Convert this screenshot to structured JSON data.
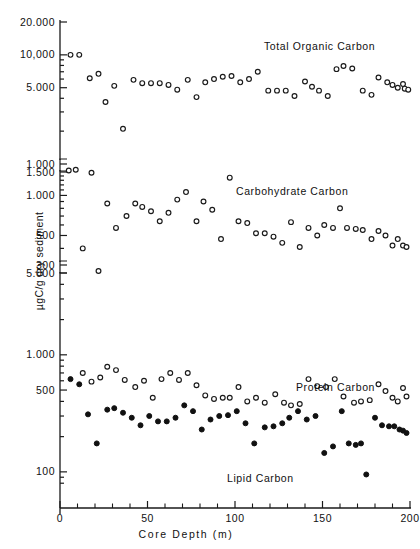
{
  "chart_data": {
    "type": "scatter",
    "title": "",
    "xlabel": "Core Depth (m)",
    "ylabel": "µgC/g dry sediment",
    "xlim": [
      0,
      200
    ],
    "xticks_major": [
      0,
      50,
      100,
      150,
      200
    ],
    "xtick_labels": [
      "0",
      "50",
      "100",
      "150",
      "200"
    ],
    "xticks_minor_step": 10,
    "grid": false,
    "legend": "inline-annotations",
    "axis_style": "three stacked broken log panels, open and filled circle markers",
    "panels": [
      {
        "name": "panel-top",
        "series_shown": [
          "Total Organic Carbon"
        ],
        "scale": "log",
        "ylim": [
          1000,
          20000
        ],
        "yticks_labeled": [
          20000,
          10000,
          5000,
          1000
        ],
        "ytick_labels": [
          "20.000",
          "10,000",
          "5.000",
          "1.000"
        ]
      },
      {
        "name": "panel-middle",
        "series_shown": [
          "Carbohydrate Carbon"
        ],
        "scale": "log",
        "ylim": [
          300,
          1500
        ],
        "yticks_labeled": [
          1500,
          1000,
          500,
          300
        ],
        "ytick_labels": [
          "1.500",
          "1.000",
          "500",
          "300"
        ]
      },
      {
        "name": "panel-bottom",
        "series_shown": [
          "Protein Carbon",
          "Lipid Carbon"
        ],
        "scale": "log",
        "ylim": [
          70,
          5000
        ],
        "yticks_labeled": [
          5000,
          1000,
          500,
          100
        ],
        "ytick_labels": [
          "5.000",
          "1.000",
          "500",
          "100"
        ]
      }
    ],
    "annotations": [
      {
        "text": "Total Organic Carbon",
        "x": 120,
        "y": 8000,
        "panel": "panel-top"
      },
      {
        "text": "Carbohydrate Carbon",
        "x": 120,
        "y": 1050,
        "panel": "panel-middle"
      },
      {
        "text": "Protein Carbon",
        "x": 152,
        "y": 560,
        "panel": "panel-bottom"
      },
      {
        "text": "Lipid Carbon",
        "x": 100,
        "y": 108,
        "panel": "panel-bottom"
      }
    ],
    "series": [
      {
        "name": "Total Organic Carbon",
        "marker": "open-circle",
        "color": "#1a1a1a",
        "points": [
          [
            6,
            10000
          ],
          [
            11,
            10000
          ],
          [
            17,
            6100
          ],
          [
            22,
            6700
          ],
          [
            26,
            3700
          ],
          [
            31,
            5200
          ],
          [
            36,
            2100
          ],
          [
            42,
            5900
          ],
          [
            47,
            5500
          ],
          [
            52,
            5500
          ],
          [
            57,
            5500
          ],
          [
            62,
            5300
          ],
          [
            67,
            4800
          ],
          [
            73,
            5900
          ],
          [
            78,
            4100
          ],
          [
            83,
            5600
          ],
          [
            88,
            6000
          ],
          [
            93,
            6300
          ],
          [
            98,
            6400
          ],
          [
            103,
            5600
          ],
          [
            108,
            6000
          ],
          [
            113,
            7000
          ],
          [
            119,
            4700
          ],
          [
            124,
            4700
          ],
          [
            129,
            4700
          ],
          [
            134,
            4200
          ],
          [
            140,
            5700
          ],
          [
            144,
            5100
          ],
          [
            148,
            4700
          ],
          [
            153,
            4200
          ],
          [
            158,
            7400
          ],
          [
            162,
            7900
          ],
          [
            167,
            7500
          ],
          [
            173,
            4700
          ],
          [
            178,
            4300
          ],
          [
            182,
            6200
          ],
          [
            187,
            5600
          ],
          [
            190,
            5300
          ],
          [
            193,
            5000
          ],
          [
            196,
            5400
          ],
          [
            197,
            4900
          ],
          [
            199,
            4800
          ]
        ]
      },
      {
        "name": "Carbohydrate Carbon",
        "marker": "open-circle",
        "color": "#1a1a1a",
        "points": [
          [
            5,
            1540
          ],
          [
            9,
            1560
          ],
          [
            13,
            400
          ],
          [
            18,
            1480
          ],
          [
            22,
            210
          ],
          [
            27,
            870
          ],
          [
            32,
            570
          ],
          [
            38,
            700
          ],
          [
            43,
            870
          ],
          [
            47,
            820
          ],
          [
            52,
            760
          ],
          [
            57,
            640
          ],
          [
            62,
            740
          ],
          [
            67,
            930
          ],
          [
            72,
            1060
          ],
          [
            78,
            640
          ],
          [
            82,
            900
          ],
          [
            87,
            780
          ],
          [
            92,
            470
          ],
          [
            97,
            1360
          ],
          [
            102,
            640
          ],
          [
            107,
            620
          ],
          [
            112,
            520
          ],
          [
            117,
            520
          ],
          [
            122,
            490
          ],
          [
            127,
            440
          ],
          [
            132,
            630
          ],
          [
            137,
            410
          ],
          [
            142,
            570
          ],
          [
            147,
            500
          ],
          [
            151,
            600
          ],
          [
            156,
            570
          ],
          [
            160,
            800
          ],
          [
            164,
            570
          ],
          [
            169,
            560
          ],
          [
            173,
            550
          ],
          [
            178,
            470
          ],
          [
            182,
            540
          ],
          [
            186,
            500
          ],
          [
            190,
            420
          ],
          [
            193,
            470
          ],
          [
            196,
            420
          ],
          [
            198,
            410
          ]
        ]
      },
      {
        "name": "Protein Carbon",
        "marker": "open-circle",
        "color": "#1a1a1a",
        "points": [
          [
            13,
            700
          ],
          [
            18,
            590
          ],
          [
            23,
            640
          ],
          [
            27,
            790
          ],
          [
            32,
            740
          ],
          [
            37,
            610
          ],
          [
            43,
            530
          ],
          [
            48,
            600
          ],
          [
            53,
            430
          ],
          [
            58,
            620
          ],
          [
            63,
            700
          ],
          [
            68,
            610
          ],
          [
            73,
            700
          ],
          [
            78,
            550
          ],
          [
            83,
            450
          ],
          [
            88,
            420
          ],
          [
            93,
            430
          ],
          [
            97,
            430
          ],
          [
            102,
            530
          ],
          [
            107,
            400
          ],
          [
            112,
            430
          ],
          [
            117,
            390
          ],
          [
            123,
            460
          ],
          [
            128,
            390
          ],
          [
            132,
            370
          ],
          [
            137,
            380
          ],
          [
            142,
            620
          ],
          [
            147,
            540
          ],
          [
            152,
            530
          ],
          [
            157,
            620
          ],
          [
            162,
            440
          ],
          [
            168,
            390
          ],
          [
            172,
            400
          ],
          [
            177,
            410
          ],
          [
            182,
            560
          ],
          [
            186,
            490
          ],
          [
            190,
            430
          ],
          [
            193,
            400
          ],
          [
            196,
            520
          ],
          [
            198,
            440
          ]
        ]
      },
      {
        "name": "Lipid Carbon",
        "marker": "filled-circle",
        "color": "#111111",
        "points": [
          [
            6,
            620
          ],
          [
            11,
            560
          ],
          [
            16,
            310
          ],
          [
            21,
            175
          ],
          [
            27,
            340
          ],
          [
            31,
            350
          ],
          [
            36,
            320
          ],
          [
            41,
            290
          ],
          [
            46,
            250
          ],
          [
            51,
            300
          ],
          [
            56,
            270
          ],
          [
            61,
            270
          ],
          [
            66,
            290
          ],
          [
            71,
            370
          ],
          [
            76,
            330
          ],
          [
            81,
            230
          ],
          [
            86,
            280
          ],
          [
            91,
            300
          ],
          [
            96,
            305
          ],
          [
            101,
            330
          ],
          [
            106,
            260
          ],
          [
            111,
            175
          ],
          [
            117,
            240
          ],
          [
            122,
            245
          ],
          [
            127,
            260
          ],
          [
            131,
            290
          ],
          [
            136,
            330
          ],
          [
            141,
            280
          ],
          [
            146,
            300
          ],
          [
            151,
            145
          ],
          [
            156,
            165
          ],
          [
            161,
            330
          ],
          [
            165,
            175
          ],
          [
            169,
            170
          ],
          [
            172,
            175
          ],
          [
            175,
            95
          ],
          [
            180,
            290
          ],
          [
            184,
            250
          ],
          [
            188,
            245
          ],
          [
            191,
            245
          ],
          [
            194,
            230
          ],
          [
            196,
            225
          ],
          [
            198,
            215
          ]
        ]
      }
    ]
  },
  "axis": {
    "x_title": "Core Depth (m)",
    "y_title": "µgC/g dry sediment",
    "y_labels_top": [
      "20.000",
      "10,000",
      "5.000",
      "1.000"
    ],
    "y_labels_mid": [
      "1.500",
      "1.000",
      "500",
      "300"
    ],
    "y_labels_bot": [
      "5.000",
      "1.000",
      "500",
      "100"
    ],
    "x_labels": [
      "0",
      "50",
      "100",
      "150",
      "200"
    ]
  },
  "labels": {
    "toc": "Total Organic Carbon",
    "carb": "Carbohydrate Carbon",
    "protein": "Protein Carbon",
    "lipid": "Lipid Carbon"
  }
}
